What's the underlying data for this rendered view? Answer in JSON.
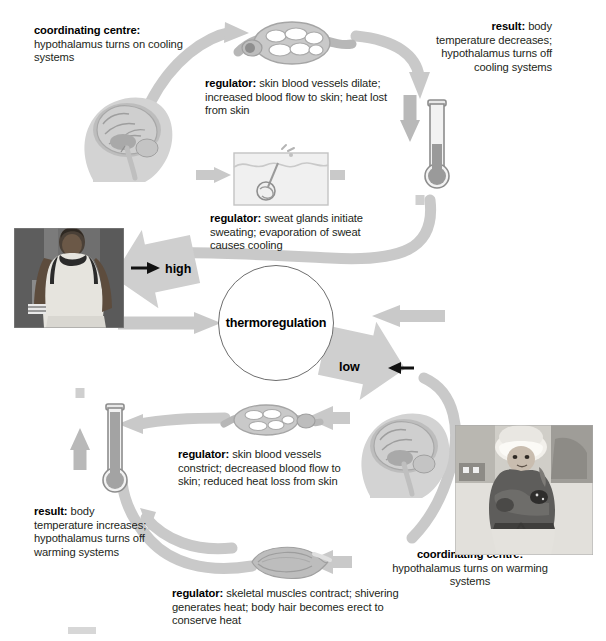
{
  "diagram": {
    "title": "thermoregulation",
    "center_label": "thermoregulation",
    "branch_labels": {
      "high": "high",
      "low": "low"
    },
    "colors": {
      "arrow_gray": "#c7c7c7",
      "arrow_gray_dark": "#b0b0b0",
      "text": "#231f20",
      "circle_stroke": "#6e6e6e",
      "photo_gray": "#8d8d8d",
      "thermometer_fill": "#8f8f8f"
    },
    "nodes": {
      "coordinating_centre_cooling": {
        "label": "coordinating centre:",
        "body": "hypothalamus turns on cooling systems",
        "align": "left"
      },
      "regulator_vasodilation": {
        "label": "regulator:",
        "body": "skin blood vessels dilate; increased blood flow to skin; heat lost from skin",
        "align": "left"
      },
      "regulator_sweating": {
        "label": "regulator:",
        "body": "sweat glands initiate sweating; evaporation of sweat causes cooling",
        "align": "left"
      },
      "result_cooling": {
        "label": "result:",
        "body": "body temperature decreases; hypothalamus turns off cooling systems",
        "align": "right"
      },
      "regulator_vasoconstriction": {
        "label": "regulator:",
        "body": "skin blood vessels constrict; decreased blood flow to skin; reduced heat loss from skin",
        "align": "left"
      },
      "regulator_shivering": {
        "label": "regulator:",
        "body": "skeletal muscles contract; shivering generates heat; body hair becomes erect to conserve heat",
        "align": "left"
      },
      "coordinating_centre_warming": {
        "label": "coordinating centre:",
        "body": "hypothalamus turns on warming systems",
        "align": "center"
      },
      "result_warming": {
        "label": "result:",
        "body": "body temperature increases; hypothalamus turns off warming systems",
        "align": "left"
      }
    },
    "illustrations": {
      "brain_top": "brain-hypothalamus-head-illustration",
      "brain_bottom": "brain-hypothalamus-head-illustration",
      "vessel_dilated": "dilated-blood-vessel-illustration",
      "vessel_constricted": "constricted-blood-vessel-illustration",
      "sweat_gland": "skin-sweat-gland-illustration",
      "muscle": "skeletal-muscle-illustration",
      "thermometer_down": "thermometer-falling-illustration",
      "thermometer_up": "thermometer-rising-illustration"
    },
    "photos": {
      "athlete": "sweating-athlete-photograph",
      "child": "shivering-child-in-winter-clothing-photograph"
    }
  }
}
